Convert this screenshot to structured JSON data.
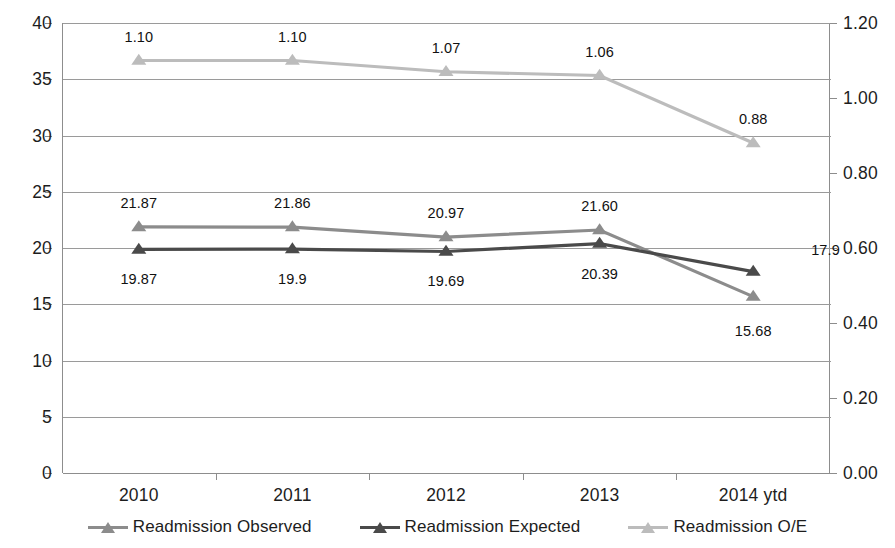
{
  "chart_data": {
    "type": "line",
    "title": "",
    "xlabel": "",
    "ylabel": "",
    "categories": [
      "2010",
      "2011",
      "2012",
      "2013",
      "2014 ytd"
    ],
    "grid": true,
    "legend_position": "bottom",
    "axes": {
      "left": {
        "ylim": [
          0,
          40
        ],
        "tick_step": 5,
        "ticks": [
          "0",
          "5",
          "10",
          "15",
          "20",
          "25",
          "30",
          "35",
          "40"
        ],
        "tick_values": [
          0,
          5,
          10,
          15,
          20,
          25,
          30,
          35,
          40
        ]
      },
      "right": {
        "ylim": [
          0,
          1.2
        ],
        "tick_step": 0.2,
        "ticks": [
          "0.00",
          "0.20",
          "0.40",
          "0.60",
          "0.80",
          "1.00",
          "1.20"
        ],
        "tick_values": [
          0,
          0.2,
          0.4,
          0.6,
          0.8,
          1.0,
          1.2
        ]
      }
    },
    "series": [
      {
        "name": "Readmission Observed",
        "axis": "left",
        "color": "#8c8c8c",
        "marker": "triangle",
        "values": [
          21.87,
          21.86,
          20.97,
          21.6,
          15.68
        ],
        "labels": [
          "21.87",
          "21.86",
          "20.97",
          "21.60",
          "15.68"
        ]
      },
      {
        "name": "Readmission Expected",
        "axis": "left",
        "color": "#4a4a4a",
        "marker": "triangle",
        "values": [
          19.87,
          19.9,
          19.69,
          20.39,
          17.9
        ],
        "labels": [
          "19.87",
          "19.9",
          "19.69",
          "20.39",
          "17.9"
        ]
      },
      {
        "name": "Readmission O/E",
        "axis": "right",
        "color": "#bcbcbc",
        "marker": "triangle",
        "values": [
          1.1,
          1.1,
          1.07,
          1.06,
          0.88
        ],
        "labels": [
          "1.10",
          "1.10",
          "1.07",
          "1.06",
          "0.88"
        ]
      }
    ]
  },
  "legend": {
    "items": [
      {
        "label": "Readmission Observed",
        "color": "#8c8c8c"
      },
      {
        "label": "Readmission Expected",
        "color": "#4a4a4a"
      },
      {
        "label": "Readmission O/E",
        "color": "#bcbcbc"
      }
    ]
  }
}
